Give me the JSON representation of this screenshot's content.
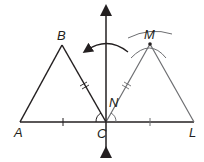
{
  "diagram": {
    "colors": {
      "primary": "#231f20",
      "image": "#6d6e71",
      "background": "#ffffff"
    },
    "points": {
      "A": {
        "label": "A",
        "x": 20,
        "y": 122
      },
      "B": {
        "label": "B",
        "x": 62,
        "y": 45
      },
      "C": {
        "label": "C",
        "x": 106,
        "y": 122
      },
      "L": {
        "label": "L",
        "x": 194,
        "y": 122
      },
      "M": {
        "label": "M",
        "x": 150,
        "y": 44
      },
      "N": {
        "label": "N"
      }
    },
    "labels": {
      "A": "A",
      "B": "B",
      "C": "C",
      "L": "L",
      "M": "M",
      "N": "N"
    }
  }
}
